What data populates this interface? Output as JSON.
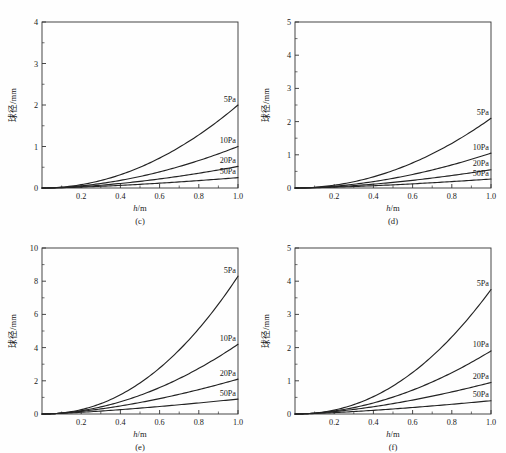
{
  "figure": {
    "background_color": "#fefefe",
    "curve_color": "#232323",
    "axis_color": "#333333",
    "panel_count": 4
  },
  "axes": {
    "xlabel_italic": "h",
    "xlabel_rest": "/m",
    "ylabel": "球径/mm"
  },
  "panels": [
    {
      "id": "c",
      "caption": "(c)",
      "ylim": [
        0,
        4
      ],
      "yticks": [
        0,
        1,
        2,
        3,
        4
      ],
      "yticklabels": [
        "0",
        "1",
        "2",
        "3",
        "4"
      ],
      "xlim": [
        0,
        1.0
      ],
      "xticks": [
        0.2,
        0.4,
        0.6,
        0.8,
        1.0
      ],
      "xticklabels": [
        "0.2",
        "0.4",
        "0.6",
        "0.8",
        "1.0"
      ],
      "series": [
        {
          "label": "5Pa",
          "end_value": 2.0,
          "exponent": 2.0
        },
        {
          "label": "10Pa",
          "end_value": 1.0,
          "exponent": 1.85
        },
        {
          "label": "20Pa",
          "end_value": 0.52,
          "exponent": 1.7
        },
        {
          "label": "50Pa",
          "end_value": 0.25,
          "exponent": 1.5
        }
      ]
    },
    {
      "id": "d",
      "caption": "(d)",
      "ylim": [
        0,
        5
      ],
      "yticks": [
        0,
        1,
        2,
        3,
        4,
        5
      ],
      "yticklabels": [
        "0",
        "1",
        "2",
        "3",
        "4",
        "5"
      ],
      "xlim": [
        0,
        1.0
      ],
      "xticks": [
        0.2,
        0.4,
        0.6,
        0.8,
        1.0
      ],
      "xticklabels": [
        "0.2",
        "0.4",
        "0.6",
        "0.8",
        "1.0"
      ],
      "series": [
        {
          "label": "5Pa",
          "end_value": 2.1,
          "exponent": 2.0
        },
        {
          "label": "10Pa",
          "end_value": 1.05,
          "exponent": 1.85
        },
        {
          "label": "20Pa",
          "end_value": 0.55,
          "exponent": 1.7
        },
        {
          "label": "50Pa",
          "end_value": 0.27,
          "exponent": 1.5
        }
      ]
    },
    {
      "id": "e",
      "caption": "(e)",
      "ylim": [
        0,
        10
      ],
      "yticks": [
        0,
        2,
        4,
        6,
        8,
        10
      ],
      "yticklabels": [
        "0",
        "2",
        "4",
        "6",
        "8",
        "10"
      ],
      "xlim": [
        0,
        1.0
      ],
      "xticks": [
        0.2,
        0.4,
        0.6,
        0.8,
        1.0
      ],
      "xticklabels": [
        "0.2",
        "0.4",
        "0.6",
        "0.8",
        "1.0"
      ],
      "series": [
        {
          "label": "5Pa",
          "end_value": 8.3,
          "exponent": 2.15
        },
        {
          "label": "10Pa",
          "end_value": 4.2,
          "exponent": 1.9
        },
        {
          "label": "20Pa",
          "end_value": 2.1,
          "exponent": 1.6
        },
        {
          "label": "50Pa",
          "end_value": 0.9,
          "exponent": 1.35
        }
      ]
    },
    {
      "id": "f",
      "caption": "(f)",
      "ylim": [
        0,
        5
      ],
      "yticks": [
        0,
        1,
        2,
        3,
        4,
        5
      ],
      "yticklabels": [
        "0",
        "1",
        "2",
        "3",
        "4",
        "5"
      ],
      "xlim": [
        0,
        1.0
      ],
      "xticks": [
        0.2,
        0.4,
        0.6,
        0.8,
        1.0
      ],
      "xticklabels": [
        "0.2",
        "0.4",
        "0.6",
        "0.8",
        "1.0"
      ],
      "series": [
        {
          "label": "5Pa",
          "end_value": 3.75,
          "exponent": 2.15
        },
        {
          "label": "10Pa",
          "end_value": 1.9,
          "exponent": 1.9
        },
        {
          "label": "20Pa",
          "end_value": 0.95,
          "exponent": 1.6
        },
        {
          "label": "50Pa",
          "end_value": 0.4,
          "exponent": 1.4
        }
      ]
    }
  ],
  "chart_data": [
    {
      "type": "line",
      "panel": "(c)",
      "title": "",
      "xlabel": "h/m",
      "ylabel": "球径/mm",
      "xlim": [
        0,
        1.0
      ],
      "ylim": [
        0,
        4
      ],
      "grid": false,
      "legend_position": "inline-right-of-curve-end",
      "x": [
        0,
        0.1,
        0.2,
        0.3,
        0.4,
        0.5,
        0.6,
        0.7,
        0.8,
        0.9,
        1.0
      ],
      "series": [
        {
          "name": "5Pa",
          "values": [
            0,
            0.02,
            0.08,
            0.18,
            0.32,
            0.5,
            0.72,
            0.98,
            1.28,
            1.62,
            2.0
          ]
        },
        {
          "name": "10Pa",
          "values": [
            0,
            0.014,
            0.05,
            0.105,
            0.18,
            0.273,
            0.384,
            0.513,
            0.659,
            0.821,
            1.0
          ]
        },
        {
          "name": "20Pa",
          "values": [
            0,
            0.01,
            0.033,
            0.066,
            0.108,
            0.159,
            0.218,
            0.285,
            0.359,
            0.441,
            0.52
          ]
        },
        {
          "name": "50Pa",
          "values": [
            0,
            0.008,
            0.022,
            0.041,
            0.063,
            0.088,
            0.116,
            0.146,
            0.179,
            0.213,
            0.25
          ]
        }
      ]
    },
    {
      "type": "line",
      "panel": "(d)",
      "title": "",
      "xlabel": "h/m",
      "ylabel": "球径/mm",
      "xlim": [
        0,
        1.0
      ],
      "ylim": [
        0,
        5
      ],
      "grid": false,
      "legend_position": "inline-right-of-curve-end",
      "x": [
        0,
        0.1,
        0.2,
        0.3,
        0.4,
        0.5,
        0.6,
        0.7,
        0.8,
        0.9,
        1.0
      ],
      "series": [
        {
          "name": "5Pa",
          "values": [
            0,
            0.021,
            0.084,
            0.189,
            0.336,
            0.525,
            0.756,
            1.029,
            1.344,
            1.701,
            2.1
          ]
        },
        {
          "name": "10Pa",
          "values": [
            0,
            0.015,
            0.052,
            0.11,
            0.189,
            0.287,
            0.403,
            0.538,
            0.692,
            0.862,
            1.05
          ]
        },
        {
          "name": "20Pa",
          "values": [
            0,
            0.011,
            0.035,
            0.07,
            0.114,
            0.168,
            0.231,
            0.302,
            0.38,
            0.466,
            0.55
          ]
        },
        {
          "name": "50Pa",
          "values": [
            0,
            0.009,
            0.024,
            0.044,
            0.068,
            0.095,
            0.125,
            0.158,
            0.193,
            0.23,
            0.27
          ]
        }
      ]
    },
    {
      "type": "line",
      "panel": "(e)",
      "title": "",
      "xlabel": "h/m",
      "ylabel": "球径/mm",
      "xlim": [
        0,
        1.0
      ],
      "ylim": [
        0,
        10
      ],
      "grid": false,
      "legend_position": "inline-right-of-curve-end",
      "x": [
        0,
        0.1,
        0.2,
        0.3,
        0.4,
        0.5,
        0.6,
        0.7,
        0.8,
        0.9,
        1.0
      ],
      "series": [
        {
          "name": "5Pa",
          "values": [
            0,
            0.059,
            0.262,
            0.622,
            1.16,
            1.883,
            2.8,
            3.918,
            5.243,
            6.781,
            8.3
          ]
        },
        {
          "name": "10Pa",
          "values": [
            0,
            0.053,
            0.198,
            0.425,
            0.74,
            1.14,
            1.627,
            2.2,
            2.86,
            3.607,
            4.2
          ]
        },
        {
          "name": "20Pa",
          "values": [
            0,
            0.053,
            0.16,
            0.312,
            0.502,
            0.728,
            0.988,
            1.281,
            1.606,
            1.962,
            2.1
          ]
        },
        {
          "name": "50Pa",
          "values": [
            0,
            0.041,
            0.104,
            0.183,
            0.274,
            0.375,
            0.486,
            0.606,
            0.734,
            0.871,
            0.9
          ]
        }
      ]
    },
    {
      "type": "line",
      "panel": "(f)",
      "title": "",
      "xlabel": "h/m",
      "ylabel": "球径/mm",
      "xlim": [
        0,
        1.0
      ],
      "ylim": [
        0,
        5
      ],
      "grid": false,
      "legend_position": "inline-right-of-curve-end",
      "x": [
        0,
        0.1,
        0.2,
        0.3,
        0.4,
        0.5,
        0.6,
        0.7,
        0.8,
        0.9,
        1.0
      ],
      "series": [
        {
          "name": "5Pa",
          "values": [
            0,
            0.027,
            0.118,
            0.281,
            0.524,
            0.851,
            1.265,
            1.77,
            2.369,
            3.064,
            3.75
          ]
        },
        {
          "name": "10Pa",
          "values": [
            0,
            0.024,
            0.09,
            0.192,
            0.335,
            0.516,
            0.736,
            0.995,
            1.294,
            1.632,
            1.9
          ]
        },
        {
          "name": "20Pa",
          "values": [
            0,
            0.024,
            0.072,
            0.141,
            0.227,
            0.329,
            0.447,
            0.58,
            0.727,
            0.888,
            0.95
          ]
        },
        {
          "name": "50Pa",
          "values": [
            0,
            0.016,
            0.042,
            0.076,
            0.116,
            0.161,
            0.211,
            0.266,
            0.325,
            0.388,
            0.4
          ]
        }
      ]
    }
  ]
}
